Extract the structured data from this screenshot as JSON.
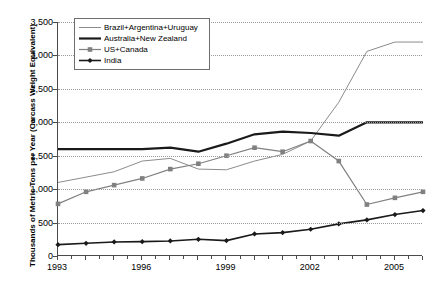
{
  "chart": {
    "type": "line",
    "title": "",
    "ylabel": "Thousands of Metric Tons per Year (Carcass Weight Equivalent)",
    "xlabel": "",
    "grid": true,
    "legend_position": "top-left",
    "ylim": [
      0,
      3500
    ],
    "xlim": [
      1993,
      2006
    ],
    "ytick_labels": [
      "3,500",
      "3,000",
      "2,500",
      "2,000",
      "1,500",
      "1,000",
      "500",
      "0"
    ],
    "ytick_values": [
      3500,
      3000,
      2500,
      2000,
      1500,
      1000,
      500,
      0
    ],
    "xtick_labels": [
      "1993",
      "1996",
      "1999",
      "2002",
      "2005"
    ],
    "xtick_values": [
      1993,
      1996,
      1999,
      2002,
      2005
    ]
  },
  "chart_data": {
    "type": "line",
    "title": "",
    "xlabel": "",
    "ylabel": "Thousands of Metric Tons per Year (Carcass Weight Equivalent)",
    "ylim": [
      0,
      3500
    ],
    "xlim": [
      1993,
      2006
    ],
    "grid": true,
    "legend_position": "top-left",
    "x": [
      1993,
      1994,
      1995,
      1996,
      1997,
      1998,
      1999,
      2000,
      2001,
      2002,
      2003,
      2004,
      2005,
      2006
    ],
    "categories": [
      "1993",
      "1994",
      "1995",
      "1996",
      "1997",
      "1998",
      "1999",
      "2000",
      "2001",
      "2002",
      "2003",
      "2004",
      "2005",
      "2006"
    ],
    "series": [
      {
        "name": "Brazil+Argentina+Uruguay",
        "color": "#8c8c8c",
        "marker": "none",
        "width": 1,
        "values": [
          1100,
          1180,
          1260,
          1420,
          1460,
          1300,
          1290,
          1420,
          1520,
          1720,
          2300,
          3060,
          3200,
          3200
        ]
      },
      {
        "name": "Australia+New Zealand",
        "color": "#1a1a1a",
        "marker": "none",
        "width": 2.2,
        "values": [
          1600,
          1600,
          1600,
          1600,
          1620,
          1560,
          1680,
          1820,
          1860,
          1840,
          1800,
          2000,
          2000,
          2000
        ]
      },
      {
        "name": "US+Canada",
        "color": "#808080",
        "marker": "square",
        "width": 1.2,
        "values": [
          780,
          960,
          1060,
          1160,
          1300,
          1380,
          1500,
          1620,
          1560,
          1720,
          1420,
          770,
          870,
          960
        ]
      },
      {
        "name": "India",
        "color": "#1a1a1a",
        "marker": "diamond",
        "width": 1.6,
        "values": [
          170,
          190,
          210,
          215,
          225,
          250,
          230,
          330,
          350,
          400,
          480,
          540,
          620,
          680
        ]
      }
    ]
  },
  "legend": {
    "items": [
      {
        "label": "Brazil+Argentina+Uruguay"
      },
      {
        "label": "Australia+New Zealand"
      },
      {
        "label": "US+Canada"
      },
      {
        "label": "India"
      }
    ]
  }
}
